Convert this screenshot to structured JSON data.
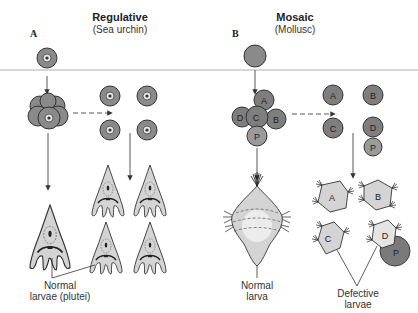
{
  "figure": {
    "panels": [
      {
        "letter": "A",
        "title": "Regulative",
        "subtitle": "(Sea urchin)",
        "caption_line1": "Normal",
        "caption_line2": "larvae (plutei)"
      },
      {
        "letter": "B",
        "title": "Mosaic",
        "subtitle": "(Mollusc)",
        "normal_caption_line1": "Normal",
        "normal_caption_line2": "larva",
        "defective_caption_line1": "Defective",
        "defective_caption_line2": "larvae"
      }
    ],
    "mosaic_cells": {
      "A": "A",
      "B": "B",
      "C": "C",
      "D": "D",
      "P": "P"
    },
    "colors": {
      "cell_fill": "#8a8a8a",
      "cell_outline": "#333333",
      "larva_fill": "#d4d4d4",
      "polar_lobe_fill": "#7a7a7a",
      "divider": "#cfcfcf"
    }
  }
}
